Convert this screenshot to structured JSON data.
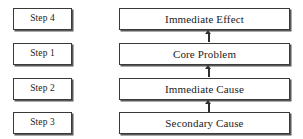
{
  "diagram": {
    "colors": {
      "box_border": "#3a3a3a",
      "box_shadow": "#585858",
      "text": "#1c1c1c",
      "arrow": "#2f2f2f",
      "background": "#ffffff"
    },
    "rows": [
      {
        "step_label": "Step 4",
        "node_label": "Immediate Effect",
        "has_incoming_arrow": true
      },
      {
        "step_label": "Step 1",
        "node_label": "Core Problem",
        "has_incoming_arrow": true
      },
      {
        "step_label": "Step 2",
        "node_label": "Immediate Cause",
        "has_incoming_arrow": true
      },
      {
        "step_label": "Step 3",
        "node_label": "Secondary Cause",
        "has_incoming_arrow": false
      }
    ],
    "arrows": [
      {
        "from": "Core Problem",
        "to": "Immediate Effect",
        "direction": "up"
      },
      {
        "from": "Immediate Cause",
        "to": "Core Problem",
        "direction": "up"
      },
      {
        "from": "Secondary Cause",
        "to": "Immediate Cause",
        "direction": "up"
      }
    ]
  }
}
